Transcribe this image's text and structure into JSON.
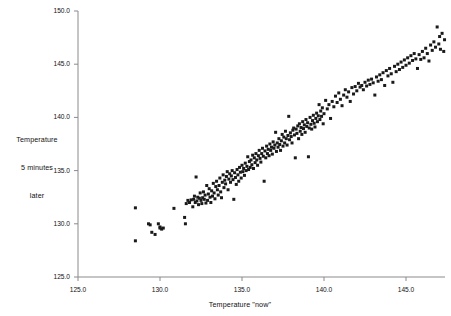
{
  "chart_data": {
    "type": "scatter",
    "title": "",
    "xlabel": "Temperature \"now\"",
    "ylabel": "Temperature 5 minutes later",
    "ylabel_lines": [
      "Temperature",
      "5 minutes",
      "later"
    ],
    "xlim": [
      125.0,
      147.6
    ],
    "ylim": [
      125.0,
      150.0
    ],
    "xticks": [
      125.0,
      130.0,
      135.0,
      140.0,
      145.0
    ],
    "yticks": [
      125.0,
      130.0,
      135.0,
      140.0,
      145.0,
      150.0
    ],
    "xtick_labels": [
      "125.0",
      "130.0",
      "135.0",
      "140.0",
      "145.0"
    ],
    "ytick_labels": [
      "125.0",
      "130.0",
      "135.0",
      "140.0",
      "145.0",
      "150.0"
    ],
    "grid": false,
    "legend": null,
    "marker": "square",
    "marker_color": "#1a1a1a",
    "marker_size_px": 3,
    "axis_color": "#8a8a8a",
    "background": "#ffffff",
    "n_points": 236,
    "points": [
      [
        128.5,
        131.5
      ],
      [
        128.5,
        128.4
      ],
      [
        129.4,
        129.9
      ],
      [
        129.5,
        129.2
      ],
      [
        129.3,
        130.0
      ],
      [
        129.7,
        129.0
      ],
      [
        129.9,
        130.0
      ],
      [
        130.0,
        129.6
      ],
      [
        130.1,
        129.5
      ],
      [
        130.0,
        129.7
      ],
      [
        130.2,
        129.6
      ],
      [
        130.85,
        131.45
      ],
      [
        131.5,
        130.6
      ],
      [
        131.6,
        131.9
      ],
      [
        131.7,
        132.2
      ],
      [
        131.55,
        130.0
      ],
      [
        131.8,
        132.0
      ],
      [
        131.9,
        132.25
      ],
      [
        132.0,
        131.6
      ],
      [
        132.05,
        132.3
      ],
      [
        132.1,
        132.6
      ],
      [
        132.2,
        134.4
      ],
      [
        132.15,
        132.0
      ],
      [
        132.25,
        132.15
      ],
      [
        132.3,
        132.5
      ],
      [
        132.35,
        131.8
      ],
      [
        132.4,
        132.4
      ],
      [
        132.45,
        132.9
      ],
      [
        132.5,
        132.2
      ],
      [
        132.55,
        131.9
      ],
      [
        132.6,
        132.45
      ],
      [
        132.65,
        133.0
      ],
      [
        132.7,
        132.3
      ],
      [
        132.75,
        132.7
      ],
      [
        132.8,
        131.95
      ],
      [
        132.85,
        133.6
      ],
      [
        132.9,
        132.2
      ],
      [
        132.95,
        132.8
      ],
      [
        133.0,
        133.3
      ],
      [
        133.05,
        132.5
      ],
      [
        133.1,
        132.0
      ],
      [
        133.15,
        133.1
      ],
      [
        133.2,
        132.6
      ],
      [
        133.25,
        133.8
      ],
      [
        133.3,
        132.9
      ],
      [
        133.35,
        132.35
      ],
      [
        133.4,
        133.5
      ],
      [
        133.45,
        134.0
      ],
      [
        133.5,
        133.2
      ],
      [
        133.55,
        132.7
      ],
      [
        133.6,
        133.6
      ],
      [
        133.65,
        134.3
      ],
      [
        133.7,
        133.0
      ],
      [
        133.75,
        132.45
      ],
      [
        133.8,
        133.9
      ],
      [
        133.85,
        134.6
      ],
      [
        133.9,
        133.4
      ],
      [
        133.95,
        134.1
      ],
      [
        134.0,
        133.75
      ],
      [
        134.05,
        134.45
      ],
      [
        134.1,
        134.9
      ],
      [
        134.15,
        133.2
      ],
      [
        134.2,
        134.2
      ],
      [
        134.25,
        134.7
      ],
      [
        134.3,
        133.9
      ],
      [
        134.35,
        134.5
      ],
      [
        134.4,
        135.0
      ],
      [
        134.45,
        134.15
      ],
      [
        134.5,
        132.3
      ],
      [
        134.55,
        134.8
      ],
      [
        134.6,
        134.35
      ],
      [
        134.65,
        133.7
      ],
      [
        134.7,
        135.1
      ],
      [
        134.75,
        134.6
      ],
      [
        134.8,
        134.0
      ],
      [
        134.85,
        135.3
      ],
      [
        134.9,
        134.85
      ],
      [
        134.95,
        134.3
      ],
      [
        135.0,
        135.5
      ],
      [
        135.05,
        134.9
      ],
      [
        135.1,
        135.2
      ],
      [
        135.15,
        134.55
      ],
      [
        135.2,
        135.7
      ],
      [
        135.25,
        135.0
      ],
      [
        135.3,
        135.4
      ],
      [
        135.35,
        136.3
      ],
      [
        135.4,
        135.1
      ],
      [
        135.45,
        135.85
      ],
      [
        135.5,
        135.3
      ],
      [
        135.55,
        136.0
      ],
      [
        135.6,
        135.55
      ],
      [
        135.65,
        136.45
      ],
      [
        135.7,
        135.2
      ],
      [
        135.75,
        136.2
      ],
      [
        135.8,
        135.75
      ],
      [
        135.85,
        136.6
      ],
      [
        135.9,
        136.0
      ],
      [
        135.95,
        135.5
      ],
      [
        136.0,
        136.4
      ],
      [
        136.05,
        136.9
      ],
      [
        136.1,
        136.15
      ],
      [
        136.15,
        135.8
      ],
      [
        136.2,
        136.6
      ],
      [
        136.25,
        137.1
      ],
      [
        136.3,
        136.35
      ],
      [
        136.35,
        134.0
      ],
      [
        136.4,
        136.85
      ],
      [
        136.45,
        136.2
      ],
      [
        136.5,
        137.3
      ],
      [
        136.55,
        136.6
      ],
      [
        136.6,
        137.0
      ],
      [
        136.65,
        136.4
      ],
      [
        136.7,
        137.5
      ],
      [
        136.75,
        136.9
      ],
      [
        136.8,
        137.2
      ],
      [
        136.85,
        136.55
      ],
      [
        136.9,
        137.7
      ],
      [
        136.95,
        137.1
      ],
      [
        137.0,
        137.4
      ],
      [
        137.05,
        138.6
      ],
      [
        137.1,
        136.8
      ],
      [
        137.15,
        137.6
      ],
      [
        137.2,
        137.2
      ],
      [
        137.25,
        138.0
      ],
      [
        137.3,
        137.45
      ],
      [
        137.35,
        136.9
      ],
      [
        137.4,
        137.8
      ],
      [
        137.45,
        138.4
      ],
      [
        137.5,
        137.3
      ],
      [
        137.55,
        138.15
      ],
      [
        137.6,
        137.6
      ],
      [
        137.65,
        138.7
      ],
      [
        137.7,
        138.0
      ],
      [
        137.75,
        137.4
      ],
      [
        137.8,
        138.3
      ],
      [
        137.85,
        140.1
      ],
      [
        137.9,
        137.9
      ],
      [
        137.95,
        138.55
      ],
      [
        138.0,
        138.2
      ],
      [
        138.05,
        137.6
      ],
      [
        138.1,
        138.8
      ],
      [
        138.15,
        139.0
      ],
      [
        138.2,
        138.35
      ],
      [
        138.25,
        136.2
      ],
      [
        138.3,
        138.9
      ],
      [
        138.35,
        138.5
      ],
      [
        138.4,
        139.2
      ],
      [
        138.45,
        138.0
      ],
      [
        138.5,
        139.4
      ],
      [
        138.55,
        138.7
      ],
      [
        138.6,
        139.05
      ],
      [
        138.65,
        138.4
      ],
      [
        138.7,
        139.6
      ],
      [
        138.75,
        138.95
      ],
      [
        138.8,
        139.3
      ],
      [
        138.85,
        138.6
      ],
      [
        138.9,
        139.8
      ],
      [
        138.95,
        139.15
      ],
      [
        139.0,
        139.5
      ],
      [
        139.05,
        136.3
      ],
      [
        139.1,
        139.0
      ],
      [
        139.15,
        140.0
      ],
      [
        139.2,
        139.35
      ],
      [
        139.25,
        138.9
      ],
      [
        139.3,
        139.7
      ],
      [
        139.35,
        140.2
      ],
      [
        139.4,
        139.45
      ],
      [
        139.45,
        139.1
      ],
      [
        139.5,
        139.9
      ],
      [
        139.55,
        140.4
      ],
      [
        139.6,
        139.6
      ],
      [
        139.65,
        140.15
      ],
      [
        139.7,
        141.2
      ],
      [
        139.75,
        139.8
      ],
      [
        139.8,
        140.6
      ],
      [
        139.85,
        140.1
      ],
      [
        139.9,
        140.9
      ],
      [
        139.95,
        139.4
      ],
      [
        140.0,
        140.35
      ],
      [
        140.1,
        141.6
      ],
      [
        140.2,
        140.8
      ],
      [
        140.3,
        141.2
      ],
      [
        140.4,
        139.9
      ],
      [
        140.5,
        141.5
      ],
      [
        140.6,
        141.0
      ],
      [
        140.7,
        142.0
      ],
      [
        140.8,
        141.4
      ],
      [
        140.9,
        142.3
      ],
      [
        141.0,
        141.7
      ],
      [
        141.1,
        141.1
      ],
      [
        141.2,
        142.1
      ],
      [
        141.3,
        142.6
      ],
      [
        141.4,
        141.9
      ],
      [
        141.5,
        142.4
      ],
      [
        141.6,
        141.5
      ],
      [
        141.7,
        142.8
      ],
      [
        141.8,
        142.2
      ],
      [
        141.9,
        142.9
      ],
      [
        142.0,
        142.5
      ],
      [
        142.1,
        143.2
      ],
      [
        142.2,
        142.85
      ],
      [
        142.3,
        143.0
      ],
      [
        142.4,
        142.6
      ],
      [
        142.5,
        143.3
      ],
      [
        142.6,
        142.95
      ],
      [
        142.7,
        143.5
      ],
      [
        142.8,
        143.1
      ],
      [
        142.9,
        143.6
      ],
      [
        143.0,
        143.25
      ],
      [
        143.1,
        142.1
      ],
      [
        143.2,
        143.8
      ],
      [
        143.3,
        143.4
      ],
      [
        143.4,
        144.0
      ],
      [
        143.5,
        143.55
      ],
      [
        143.6,
        144.2
      ],
      [
        143.7,
        143.0
      ],
      [
        143.8,
        144.4
      ],
      [
        143.9,
        143.9
      ],
      [
        144.0,
        144.6
      ],
      [
        144.1,
        144.1
      ],
      [
        144.2,
        143.3
      ],
      [
        144.3,
        144.8
      ],
      [
        144.4,
        144.3
      ],
      [
        144.5,
        145.0
      ],
      [
        144.6,
        144.5
      ],
      [
        144.7,
        145.2
      ],
      [
        144.8,
        144.7
      ],
      [
        144.9,
        145.4
      ],
      [
        145.0,
        144.9
      ],
      [
        145.1,
        145.6
      ],
      [
        145.2,
        145.1
      ],
      [
        145.3,
        145.8
      ],
      [
        145.4,
        145.35
      ],
      [
        145.5,
        146.0
      ],
      [
        145.6,
        145.5
      ],
      [
        145.7,
        144.6
      ],
      [
        145.8,
        145.9
      ],
      [
        145.9,
        145.45
      ],
      [
        146.0,
        146.2
      ],
      [
        146.1,
        145.6
      ],
      [
        146.2,
        146.5
      ],
      [
        146.3,
        146.0
      ],
      [
        146.4,
        145.3
      ],
      [
        146.5,
        146.8
      ],
      [
        146.6,
        146.3
      ],
      [
        146.7,
        147.1
      ],
      [
        146.8,
        146.6
      ],
      [
        146.9,
        148.5
      ],
      [
        147.0,
        146.9
      ],
      [
        147.05,
        147.6
      ],
      [
        147.1,
        146.4
      ],
      [
        147.2,
        147.9
      ],
      [
        147.3,
        146.2
      ],
      [
        147.35,
        147.3
      ]
    ]
  },
  "axes": {
    "x_title": "Temperature \"now\"",
    "y_title_line1": "Temperature",
    "y_title_line2": "5 minutes",
    "y_title_line3": "later"
  }
}
